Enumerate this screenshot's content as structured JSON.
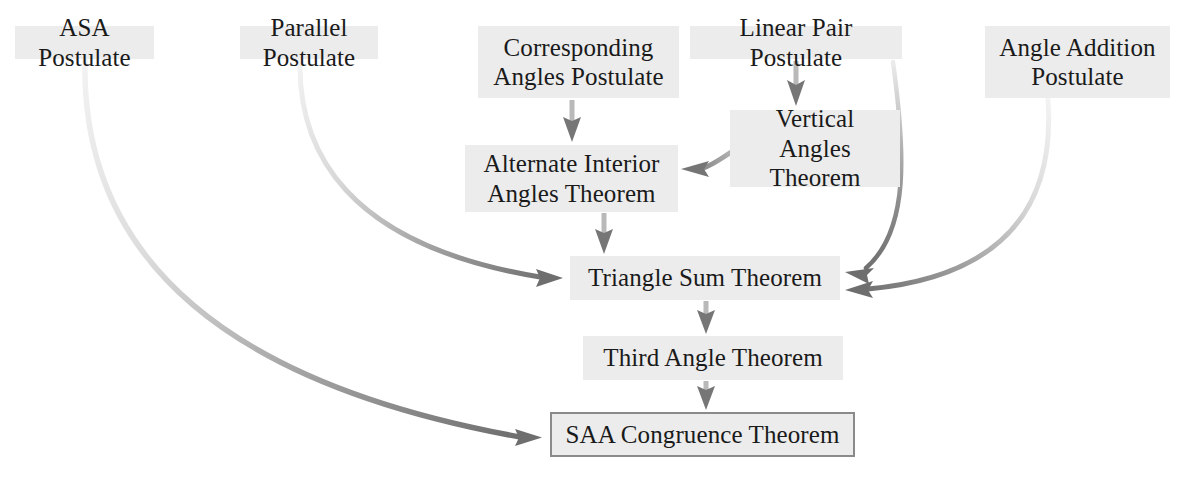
{
  "diagram": {
    "box_fill": "#ececec",
    "box_text_color": "#1a1a1a",
    "arrow_color_dark": "#6e6e6e",
    "arrow_color_light": "#e3e3e3",
    "outline_color": "#8a8a8a",
    "nodes": [
      {
        "id": "asa",
        "label": "ASA Postulate",
        "x": 15,
        "y": 26,
        "w": 139,
        "h": 33,
        "outlined": false,
        "font": 25
      },
      {
        "id": "parallel",
        "label": "Parallel Postulate",
        "x": 240,
        "y": 26,
        "w": 138,
        "h": 33,
        "outlined": false,
        "font": 25
      },
      {
        "id": "corresponding",
        "label": "Corresponding\nAngles Postulate",
        "x": 478,
        "y": 26,
        "w": 201,
        "h": 72,
        "outlined": false,
        "font": 25
      },
      {
        "id": "linearpair",
        "label": "Linear Pair Postulate",
        "x": 690,
        "y": 26,
        "w": 212,
        "h": 33,
        "outlined": false,
        "font": 25
      },
      {
        "id": "angleaddition",
        "label": "Angle Addition\nPostulate",
        "x": 985,
        "y": 26,
        "w": 185,
        "h": 72,
        "outlined": false,
        "font": 25
      },
      {
        "id": "verticalangles",
        "label": "Vertical Angles\nTheorem",
        "x": 730,
        "y": 110,
        "w": 170,
        "h": 77,
        "outlined": false,
        "font": 25
      },
      {
        "id": "altinterior",
        "label": "Alternate Interior\nAngles Theorem",
        "x": 465,
        "y": 145,
        "w": 213,
        "h": 67,
        "outlined": false,
        "font": 25
      },
      {
        "id": "trianglesum",
        "label": "Triangle Sum Theorem",
        "x": 570,
        "y": 256,
        "w": 270,
        "h": 44,
        "outlined": false,
        "font": 25
      },
      {
        "id": "thirdangle",
        "label": "Third Angle Theorem",
        "x": 583,
        "y": 336,
        "w": 260,
        "h": 44,
        "outlined": false,
        "font": 25
      },
      {
        "id": "saa",
        "label": "SAA Congruence Theorem",
        "x": 550,
        "y": 412,
        "w": 305,
        "h": 45,
        "outlined": true,
        "font": 25
      }
    ],
    "edges": [
      {
        "id": "asa-to-saa",
        "from": "asa",
        "to": "saa",
        "kind": "curve-long-left"
      },
      {
        "id": "parallel-to-trianglesum",
        "from": "parallel",
        "to": "trianglesum",
        "kind": "curve-left"
      },
      {
        "id": "corresponding-to-altinterior",
        "from": "corresponding",
        "to": "altinterior",
        "kind": "straight-down"
      },
      {
        "id": "linearpair-to-verticalangles",
        "from": "linearpair",
        "to": "verticalangles",
        "kind": "straight-down"
      },
      {
        "id": "verticalangles-to-altinterior",
        "from": "verticalangles",
        "to": "altinterior",
        "kind": "curve-short-left"
      },
      {
        "id": "altinterior-to-trianglesum",
        "from": "altinterior",
        "to": "trianglesum",
        "kind": "straight-down"
      },
      {
        "id": "linearpair-to-trianglesum",
        "from": "linearpair",
        "to": "trianglesum",
        "kind": "curve-right-inner"
      },
      {
        "id": "angleaddition-to-trianglesum",
        "from": "angleaddition",
        "to": "trianglesum",
        "kind": "curve-right-outer"
      },
      {
        "id": "trianglesum-to-thirdangle",
        "from": "trianglesum",
        "to": "thirdangle",
        "kind": "straight-down"
      },
      {
        "id": "thirdangle-to-saa",
        "from": "thirdangle",
        "to": "saa",
        "kind": "straight-down"
      }
    ]
  }
}
